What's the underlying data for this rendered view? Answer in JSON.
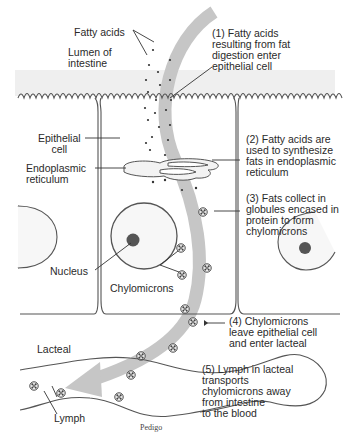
{
  "diagram": {
    "type": "biological-process",
    "colors": {
      "line": "#5a5a5a",
      "arrow": "#c4c4c4",
      "lumen_shade": "#ececec",
      "nucleolus": "#555555",
      "text": "#2a2a2a"
    },
    "labels": {
      "fatty_acids": "Fatty acids",
      "lumen": "Lumen of\nintestine",
      "epithelial_cell": "Epithelial\ncell",
      "endoplasmic_reticulum": "Endoplasmic\nreticulum",
      "nucleus": "Nucleus",
      "chylomicrons": "Chylomicrons",
      "lacteal": "Lacteal",
      "lymph": "Lymph"
    },
    "steps": [
      {
        "number": 1,
        "text": "(1) Fatty acids\nresulting from fat\ndigestion enter\nepithelial cell"
      },
      {
        "number": 2,
        "text": "(2) Fatty acids are\nused to synthesize\nfats in endoplasmic\nreticulum"
      },
      {
        "number": 3,
        "text": "(3) Fats collect in\nglobules encased in\nprotein to form\nchylomicrons"
      },
      {
        "number": 4,
        "text": "(4) Chylomicrons\nleave epithelial cell\nand enter lacteal"
      },
      {
        "number": 5,
        "text": "(5) Lymph in lacteal\ntransports\nchylomicrons away\nfrom intestine\nto the blood"
      }
    ],
    "signature": "Pedigo"
  }
}
